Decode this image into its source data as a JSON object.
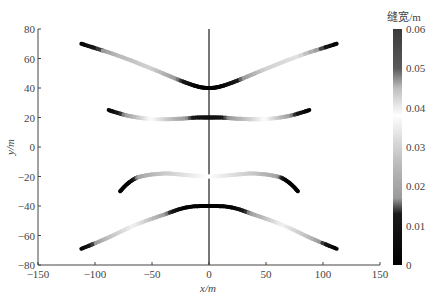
{
  "chart_data": {
    "type": "line",
    "title": "",
    "xlabel": "x/m",
    "ylabel": "y/m",
    "xlim": [
      -150,
      150
    ],
    "ylim": [
      -80,
      80
    ],
    "xticks": [
      -150,
      -100,
      -50,
      0,
      50,
      100,
      150
    ],
    "yticks": [
      80,
      60,
      40,
      20,
      0,
      -20,
      -40,
      -60,
      -80
    ],
    "grid": false,
    "vertical_line_x": 0,
    "colorbar": {
      "title": "缝宽/m",
      "min": 0,
      "max": 0.06,
      "ticks": [
        0.06,
        0.05,
        0.04,
        0.03,
        0.02,
        0.01,
        0
      ],
      "colormap": [
        {
          "v": 0.0,
          "color": "#000000"
        },
        {
          "v": 0.013,
          "color": "#1a1a1a"
        },
        {
          "v": 0.017,
          "color": "#9a9a9a"
        },
        {
          "v": 0.025,
          "color": "#b8b8b8"
        },
        {
          "v": 0.032,
          "color": "#dcdcdc"
        },
        {
          "v": 0.038,
          "color": "#ffffff"
        },
        {
          "v": 0.045,
          "color": "#bdbdbd"
        },
        {
          "v": 0.05,
          "color": "#5a5a5a"
        },
        {
          "v": 0.06,
          "color": "#3a3a3a"
        }
      ]
    },
    "series": [
      {
        "name": "fracture-1 (top)",
        "points": [
          {
            "x": -112,
            "y": 70,
            "w": 0.0
          },
          {
            "x": -80,
            "y": 62,
            "w": 0.025
          },
          {
            "x": -50,
            "y": 53,
            "w": 0.03
          },
          {
            "x": -25,
            "y": 45,
            "w": 0.015
          },
          {
            "x": -10,
            "y": 41,
            "w": 0.0
          },
          {
            "x": 0,
            "y": 40,
            "w": 0.0
          },
          {
            "x": 10,
            "y": 41,
            "w": 0.0
          },
          {
            "x": 25,
            "y": 45,
            "w": 0.012
          },
          {
            "x": 50,
            "y": 53,
            "w": 0.03
          },
          {
            "x": 80,
            "y": 62,
            "w": 0.033
          },
          {
            "x": 112,
            "y": 70,
            "w": 0.0
          }
        ]
      },
      {
        "name": "fracture-2",
        "points": [
          {
            "x": -88,
            "y": 25,
            "w": 0.0
          },
          {
            "x": -70,
            "y": 21,
            "w": 0.02
          },
          {
            "x": -50,
            "y": 19,
            "w": 0.038
          },
          {
            "x": -30,
            "y": 19,
            "w": 0.025
          },
          {
            "x": -10,
            "y": 20,
            "w": 0.01
          },
          {
            "x": 0,
            "y": 20,
            "w": 0.008
          },
          {
            "x": 10,
            "y": 20,
            "w": 0.01
          },
          {
            "x": 30,
            "y": 19,
            "w": 0.025
          },
          {
            "x": 50,
            "y": 19,
            "w": 0.038
          },
          {
            "x": 70,
            "y": 21,
            "w": 0.02
          },
          {
            "x": 88,
            "y": 25,
            "w": 0.0
          }
        ]
      },
      {
        "name": "fracture-3",
        "points": [
          {
            "x": -78,
            "y": -30,
            "w": 0.0
          },
          {
            "x": -70,
            "y": -24,
            "w": 0.0
          },
          {
            "x": -60,
            "y": -20,
            "w": 0.02
          },
          {
            "x": -40,
            "y": -18,
            "w": 0.028
          },
          {
            "x": -20,
            "y": -19,
            "w": 0.033
          },
          {
            "x": 0,
            "y": -20,
            "w": 0.038
          },
          {
            "x": 20,
            "y": -19,
            "w": 0.033
          },
          {
            "x": 40,
            "y": -18,
            "w": 0.028
          },
          {
            "x": 60,
            "y": -20,
            "w": 0.02
          },
          {
            "x": 70,
            "y": -24,
            "w": 0.0
          },
          {
            "x": 78,
            "y": -30,
            "w": 0.0
          }
        ]
      },
      {
        "name": "fracture-4 (bottom)",
        "points": [
          {
            "x": -112,
            "y": -69,
            "w": 0.0
          },
          {
            "x": -90,
            "y": -62,
            "w": 0.025
          },
          {
            "x": -65,
            "y": -53,
            "w": 0.036
          },
          {
            "x": -40,
            "y": -46,
            "w": 0.02
          },
          {
            "x": -20,
            "y": -41,
            "w": 0.0
          },
          {
            "x": 0,
            "y": -40,
            "w": 0.0
          },
          {
            "x": 20,
            "y": -41,
            "w": 0.0
          },
          {
            "x": 40,
            "y": -46,
            "w": 0.02
          },
          {
            "x": 65,
            "y": -53,
            "w": 0.036
          },
          {
            "x": 90,
            "y": -62,
            "w": 0.025
          },
          {
            "x": 112,
            "y": -69,
            "w": 0.0
          }
        ]
      }
    ]
  }
}
